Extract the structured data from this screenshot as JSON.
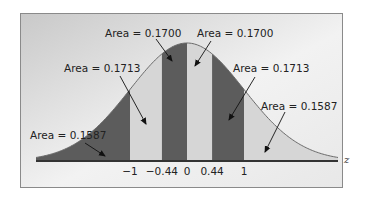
{
  "chart_data": {
    "type": "area",
    "title": "",
    "xlabel": "z",
    "ylabel": "",
    "xlim": [
      -3,
      3
    ],
    "grid": false,
    "distribution": "standard normal",
    "x_ticks": [
      {
        "value": -1,
        "label": "−1"
      },
      {
        "value": -0.44,
        "label": "−0.44"
      },
      {
        "value": 0,
        "label": "0"
      },
      {
        "value": 0.44,
        "label": "0.44"
      },
      {
        "value": 1,
        "label": "1"
      }
    ],
    "regions": [
      {
        "from": -3,
        "to": -1,
        "area": 0.1587,
        "label": "Area = 0.1587",
        "shade": "dark"
      },
      {
        "from": -1,
        "to": -0.44,
        "area": 0.1713,
        "label": "Area = 0.1713",
        "shade": "light"
      },
      {
        "from": -0.44,
        "to": 0,
        "area": 0.17,
        "label": "Area = 0.1700",
        "shade": "dark"
      },
      {
        "from": 0,
        "to": 0.44,
        "area": 0.17,
        "label": "Area = 0.1700",
        "shade": "light"
      },
      {
        "from": 0.44,
        "to": 1,
        "area": 0.1713,
        "label": "Area = 0.1713",
        "shade": "dark"
      },
      {
        "from": 1,
        "to": 3,
        "area": 0.1587,
        "label": "Area = 0.1587",
        "shade": "light"
      }
    ],
    "colors": {
      "dark": "#5c5c5c",
      "light": "#d6d6d6",
      "curve": "#6a6a6a",
      "axis": "#333333",
      "frame": "#8a8a8a"
    }
  }
}
